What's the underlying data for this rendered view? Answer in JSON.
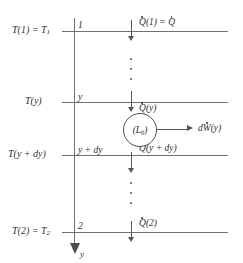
{
  "figure": {
    "type": "thermodynamic-schematic",
    "axis": {
      "name": "y",
      "direction": "downward",
      "arrowhead": "solid"
    },
    "stations": [
      {
        "id": "station-1",
        "temperature_label": "T(1) = T",
        "temperature_sub": "1",
        "marker": "1",
        "heat_label": "Q(1) = Q",
        "heat_label_plain": "Qdot(1) = Qdot",
        "line_y": 31
      },
      {
        "id": "station-y",
        "temperature_label": "T(y)",
        "temperature_sub": "",
        "marker": "y",
        "heat_label": "Q(y)",
        "heat_label_plain": "Qdot(y)",
        "line_y": 102
      },
      {
        "id": "station-y-dy",
        "temperature_label": "T(y + dy)",
        "temperature_sub": "",
        "marker": "y + dy",
        "heat_label": "Q(y + dy)",
        "heat_label_plain": "Qdot(y + dy)",
        "line_y": 155
      },
      {
        "id": "station-2",
        "temperature_label": "T(2) = T",
        "temperature_sub": "2",
        "marker": "2",
        "heat_label": "Q(2)",
        "heat_label_plain": "Qdot(2)",
        "line_y": 232
      }
    ],
    "device": {
      "label_open": "(L",
      "label_sub": "ij",
      "label_close": ")",
      "label_plain": "(L_ij)",
      "shape": "circle"
    },
    "work_output": {
      "label_prefix": "d",
      "label_symbol": "W",
      "label_suffix": "(y)",
      "label_plain": "dWdot(y)",
      "direction": "right"
    },
    "ellipses": [
      {
        "id": "ellipsis-upper",
        "dots": 3
      },
      {
        "id": "ellipsis-lower",
        "dots": 3
      }
    ],
    "colors": {
      "stroke": "#6f6f77",
      "text": "#2e2e33",
      "background": "#ffffff"
    }
  }
}
